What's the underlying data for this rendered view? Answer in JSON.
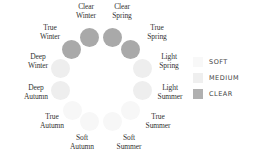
{
  "diagram": {
    "type": "color-season-wheel",
    "seasons": [
      {
        "name_line1": "Clear",
        "name_line2": "Winter",
        "category": "clear"
      },
      {
        "name_line1": "Clear",
        "name_line2": "Spring",
        "category": "clear"
      },
      {
        "name_line1": "True",
        "name_line2": "Spring",
        "category": "clear"
      },
      {
        "name_line1": "Light",
        "name_line2": "Spring",
        "category": "medium"
      },
      {
        "name_line1": "Light",
        "name_line2": "Summer",
        "category": "medium"
      },
      {
        "name_line1": "True",
        "name_line2": "Summer",
        "category": "soft"
      },
      {
        "name_line1": "Soft",
        "name_line2": "Summer",
        "category": "soft"
      },
      {
        "name_line1": "Soft",
        "name_line2": "Autumn",
        "category": "soft"
      },
      {
        "name_line1": "True",
        "name_line2": "Autumn",
        "category": "soft"
      },
      {
        "name_line1": "Deep",
        "name_line2": "Autumn",
        "category": "medium"
      },
      {
        "name_line1": "Deep",
        "name_line2": "Winter",
        "category": "medium"
      },
      {
        "name_line1": "True",
        "name_line2": "Winter",
        "category": "clear"
      }
    ]
  },
  "legend": {
    "items": [
      {
        "label": "SOFT",
        "color": "#f8f8f8"
      },
      {
        "label": "MEDIUM",
        "color": "#efefef"
      },
      {
        "label": "CLEAR",
        "color": "#b0b0b0"
      }
    ]
  },
  "colors": {
    "clear": "#a9a9a9",
    "medium": "#eeeeee",
    "soft": "#f7f7f7",
    "text": "#333333"
  }
}
